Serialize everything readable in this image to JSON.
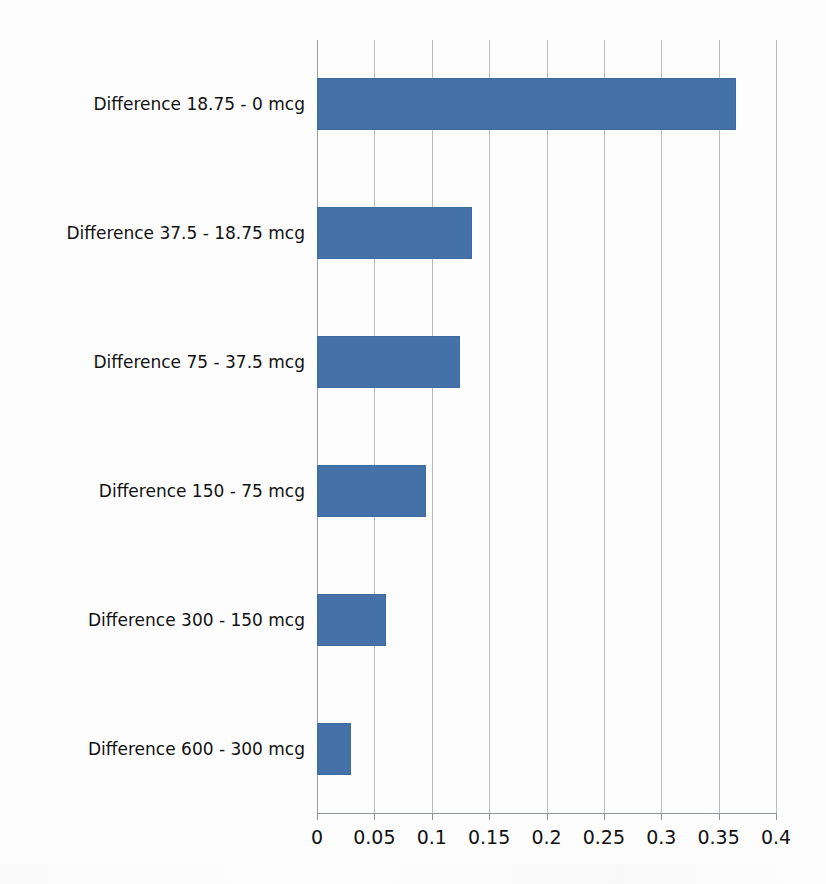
{
  "chart_data": {
    "type": "bar",
    "orientation": "horizontal",
    "title": "",
    "xlabel": "",
    "ylabel": "",
    "categories": [
      "Difference 18.75 - 0 mcg",
      "Difference 37.5 - 18.75 mcg",
      "Difference 75 - 37.5 mcg",
      "Difference 150 - 75 mcg",
      "Difference 300 - 150 mcg",
      "Difference 600 - 300 mcg"
    ],
    "values": [
      0.365,
      0.135,
      0.125,
      0.095,
      0.06,
      0.03
    ],
    "xlim": [
      0,
      0.4
    ],
    "xticks": [
      0,
      0.05,
      0.1,
      0.15,
      0.2,
      0.25,
      0.3,
      0.35,
      0.4
    ],
    "xtick_labels": [
      "0",
      "0.05",
      "0.1",
      "0.15",
      "0.2",
      "0.25",
      "0.3",
      "0.35",
      "0.4"
    ],
    "grid": "vertical",
    "legend": "none",
    "series_color": "#4472A8",
    "gridline_color": "#B7BCC4",
    "axis_color": "#8D939B",
    "background": "#FDFDFD"
  }
}
